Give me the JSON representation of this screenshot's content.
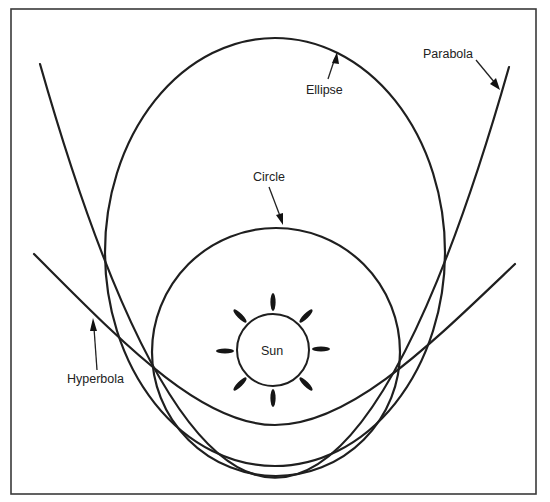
{
  "diagram": {
    "labels": {
      "ellipse": "Ellipse",
      "parabola": "Parabola",
      "circle": "Circle",
      "hyperbola": "Hyperbola",
      "sun": "Sun"
    },
    "curves": [
      {
        "name": "Ellipse",
        "type": "closed"
      },
      {
        "name": "Circle",
        "type": "closed"
      },
      {
        "name": "Parabola",
        "type": "open"
      },
      {
        "name": "Hyperbola",
        "type": "open"
      }
    ],
    "sun_rays": 8,
    "colors": {
      "stroke": "#1f1f1f",
      "background": "#ffffff",
      "frame": "#3a3a3a"
    }
  }
}
